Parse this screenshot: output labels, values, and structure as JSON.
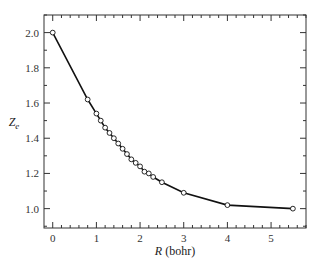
{
  "chart_data": {
    "type": "line",
    "title": "",
    "xlabel_italic": "R",
    "xlabel_unit": " (bohr)",
    "xlabel": "R (bohr)",
    "ylabel_main": "Z",
    "ylabel_sub": "e",
    "ylabel": "Z_e",
    "xlim": [
      -0.2,
      5.8
    ],
    "ylim": [
      0.89,
      2.1
    ],
    "xticks": [
      0,
      1,
      2,
      3,
      4,
      5
    ],
    "xtick_labels": [
      "0",
      "1",
      "2",
      "3",
      "4",
      "5"
    ],
    "yticks": [
      1.0,
      1.2,
      1.4,
      1.6,
      1.8,
      2.0
    ],
    "ytick_labels": [
      "1.0",
      "1.2",
      "1.4",
      "1.6",
      "1.8",
      "2.0"
    ],
    "x_minor_step": 0.2,
    "y_minor_step": 0.1,
    "grid": false,
    "legend": null,
    "marker": "open-circle",
    "series": [
      {
        "name": "Ze",
        "x": [
          0,
          0.8,
          1.0,
          1.1,
          1.2,
          1.3,
          1.4,
          1.5,
          1.6,
          1.7,
          1.8,
          1.9,
          2.0,
          2.1,
          2.2,
          2.3,
          2.5,
          3.0,
          4.0,
          5.5
        ],
        "y": [
          2.0,
          1.62,
          1.54,
          1.5,
          1.46,
          1.43,
          1.4,
          1.37,
          1.34,
          1.31,
          1.28,
          1.26,
          1.24,
          1.21,
          1.2,
          1.18,
          1.15,
          1.09,
          1.02,
          1.0
        ]
      }
    ]
  },
  "colors": {
    "line": "#111111",
    "axis": "#333333",
    "marker_fill": "#ffffff"
  }
}
